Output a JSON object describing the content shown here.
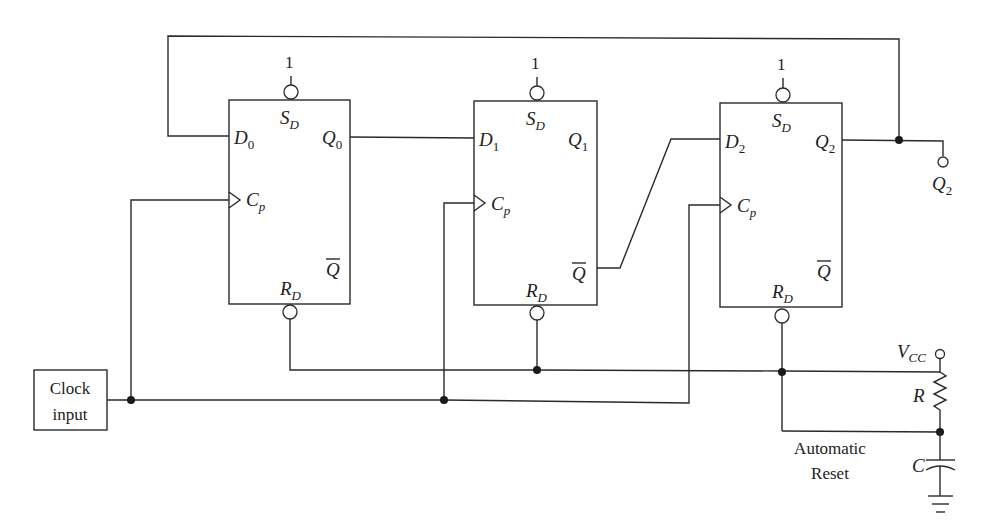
{
  "diagram": {
    "type": "circuit-schematic",
    "flipflops": [
      {
        "id": "ff0",
        "set_label": "S",
        "set_sub": "D",
        "set_value": "1",
        "d_label": "D",
        "d_sub": "0",
        "q_label": "Q",
        "q_sub": "0",
        "clk_label": "C",
        "clk_sub": "p",
        "qbar_label": "Q",
        "reset_label": "R",
        "reset_sub": "D"
      },
      {
        "id": "ff1",
        "set_label": "S",
        "set_sub": "D",
        "set_value": "1",
        "d_label": "D",
        "d_sub": "1",
        "q_label": "Q",
        "q_sub": "1",
        "clk_label": "C",
        "clk_sub": "p",
        "qbar_label": "Q",
        "reset_label": "R",
        "reset_sub": "D"
      },
      {
        "id": "ff2",
        "set_label": "S",
        "set_sub": "D",
        "set_value": "1",
        "d_label": "D",
        "d_sub": "2",
        "q_label": "Q",
        "q_sub": "2",
        "clk_label": "C",
        "clk_sub": "p",
        "qbar_label": "Q",
        "reset_label": "R",
        "reset_sub": "D"
      }
    ],
    "clock": {
      "line1": "Clock",
      "line2": "input"
    },
    "output": {
      "label": "Q",
      "sub": "2"
    },
    "reset_circuit": {
      "vcc_label": "V",
      "vcc_sub": "CC",
      "resistor_label": "R",
      "capacitor_label": "C",
      "caption_line1": "Automatic",
      "caption_line2": "Reset"
    },
    "connections": [
      "Q0 -> D1",
      "Qbar1 -> D2",
      "Q2 -> D0 (feedback)",
      "Q2 -> output terminal",
      "Clock input -> Cp of all flip-flops",
      "RD of all flip-flops -> RC automatic reset node"
    ]
  }
}
